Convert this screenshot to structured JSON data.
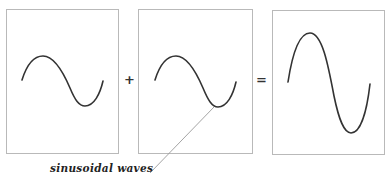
{
  "diagram": {
    "panels": [
      {
        "id": "wave-a",
        "label": "input wave 1",
        "amplitude": 1,
        "wave": {
          "start": [
            22,
            80
          ],
          "peak": [
            43,
            56
          ],
          "trough": [
            83,
            106
          ],
          "end": [
            103,
            81
          ]
        }
      },
      {
        "id": "wave-b",
        "label": "input wave 2",
        "amplitude": 1,
        "wave": {
          "start": [
            155,
            80
          ],
          "peak": [
            175,
            56
          ],
          "trough": [
            216,
            107
          ],
          "end": [
            236,
            82
          ]
        }
      },
      {
        "id": "wave-sum",
        "label": "resulting wave",
        "amplitude": 2,
        "wave": {
          "start": [
            288,
            82
          ],
          "peak": [
            309,
            33
          ],
          "trough": [
            350,
            133
          ],
          "end": [
            370,
            84
          ]
        }
      }
    ],
    "operators": {
      "plus": "+",
      "equals": "="
    },
    "annotation": {
      "text": "sinusoidal waves",
      "points_to": "wave-b trough"
    },
    "colors": {
      "panel_border": "#b9b9b9",
      "wave_stroke": "#333333",
      "leader_line": "#9a9a9a",
      "background": "#ffffff"
    }
  }
}
